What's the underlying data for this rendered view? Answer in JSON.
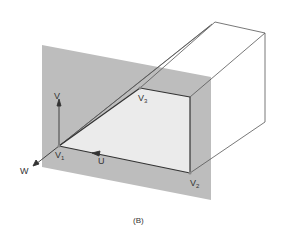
{
  "figure": {
    "caption": "(B)",
    "labels": {
      "v_axis": "V",
      "u_axis": "U",
      "w_axis": "W",
      "v1": "V",
      "v1_sub": "1",
      "v2": "V",
      "v2_sub": "2",
      "v3": "V",
      "v3_sub": "3"
    },
    "colors": {
      "plane": "#bdbdbd",
      "face": "#e9e9e9",
      "edge": "#333333",
      "box_edge": "#555555"
    }
  }
}
